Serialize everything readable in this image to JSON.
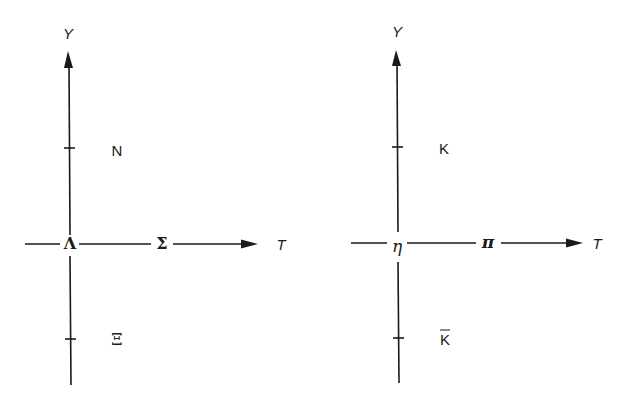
{
  "diagrams": [
    {
      "name": "baryon-octet",
      "vertical_axis_label": "Y",
      "horizontal_axis_label": "T",
      "origin_label": "Λ",
      "axis_point_label": "Σ",
      "upper_label": "N",
      "lower_label": "Ξ"
    },
    {
      "name": "meson-octet",
      "vertical_axis_label": "Y",
      "horizontal_axis_label": "T",
      "origin_label": "η",
      "axis_point_label": "π",
      "upper_label": "K",
      "lower_label": "K"
    }
  ],
  "colors": {
    "ink": "#1a1a1a",
    "background": "#ffffff"
  }
}
